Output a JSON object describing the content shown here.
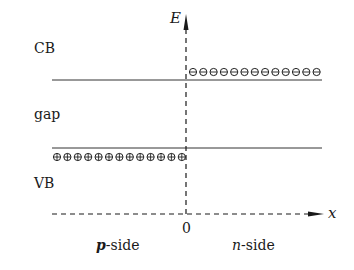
{
  "diagram": {
    "axes": {
      "y_label": "E",
      "x_label": "x",
      "origin_label": "0"
    },
    "region_labels": {
      "cb": "CB",
      "gap": "gap",
      "vb": "VB"
    },
    "side_labels": {
      "p_prefix": "p",
      "p_suffix": "-side",
      "n_prefix": "n",
      "n_suffix": "-side"
    },
    "carriers": {
      "electrons": {
        "symbol": "⊖",
        "count": 13,
        "location": "n-side conduction band edge"
      },
      "holes": {
        "symbol": "⊕",
        "count": 13,
        "location": "p-side valence band edge"
      }
    },
    "colors": {
      "line": "#333333",
      "text": "#1a1a1a"
    }
  }
}
